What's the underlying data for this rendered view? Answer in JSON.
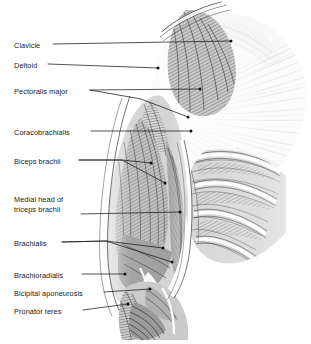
{
  "figure": {
    "background_color": "#ffffff",
    "ink_color": "#1a1a1a",
    "width": 311,
    "height": 344,
    "style": "grayscale engraved anatomical illustration"
  },
  "labels": [
    {
      "id": "clavicle",
      "text": "Clavicle",
      "text2": "",
      "x": 14,
      "y": 41,
      "lines": 1
    },
    {
      "id": "deltoid",
      "text": "Deltoid",
      "text2": "",
      "x": 14,
      "y": 61,
      "lines": 1
    },
    {
      "id": "pectoralis-major",
      "text": "Pectoralis major",
      "text2": "",
      "x": 14,
      "y": 87,
      "lines": 1
    },
    {
      "id": "coracobrachialis",
      "text": "Coracobrachialis",
      "text2": "",
      "x": 14,
      "y": 128,
      "lines": 1
    },
    {
      "id": "biceps-brachii",
      "text": "Biceps brachii",
      "text2": "",
      "x": 14,
      "y": 157,
      "lines": 1
    },
    {
      "id": "triceps-brachii",
      "text": "Medial head of",
      "text2": "triceps brachii",
      "x": 14,
      "y": 195,
      "lines": 2
    },
    {
      "id": "brachialis",
      "text": "Brachialis",
      "text2": "",
      "x": 14,
      "y": 239,
      "lines": 1
    },
    {
      "id": "brachioradialis",
      "text": "Brachioradialis",
      "text2": "",
      "x": 14,
      "y": 271,
      "lines": 1
    },
    {
      "id": "bicipital-aponeurosis",
      "text": "Bicipital aponeurosis",
      "text2": "",
      "x": 14,
      "y": 289,
      "lines": 1
    },
    {
      "id": "pronator-teres",
      "text": "Pronator teres",
      "text2": "",
      "x": 14,
      "y": 307,
      "lines": 1
    }
  ],
  "leaders": [
    {
      "id": "clavicle-leader",
      "path": "M 53 44 L 231 41",
      "dot": [
        231,
        41
      ]
    },
    {
      "id": "deltoid-leader",
      "path": "M 48 64 L 158 68",
      "dot": [
        158,
        68
      ]
    },
    {
      "id": "pectoralis-major-leader-a",
      "path": "M 90 90 L 200 89",
      "dot": [
        200,
        89
      ]
    },
    {
      "id": "pectoralis-major-leader-b",
      "path": "M 90 90 L 141 99 L 188 117",
      "dot": [
        188,
        117
      ]
    },
    {
      "id": "coracobrachialis-leader",
      "path": "M 91 131 L 191 131",
      "dot": [
        191,
        131
      ]
    },
    {
      "id": "biceps-brachii-leader-a",
      "path": "M 79 160 L 122 160 L 151 163",
      "dot": [
        151,
        163
      ]
    },
    {
      "id": "biceps-brachii-leader-b",
      "path": "M 79 160 L 122 160 L 165 183",
      "dot": [
        165,
        183
      ]
    },
    {
      "id": "triceps-brachii-leader",
      "path": "M 81 214 L 180 212",
      "dot": [
        180,
        212
      ]
    },
    {
      "id": "brachialis-leader-a",
      "path": "M 62 242 L 106 241 L 163 248",
      "dot": [
        163,
        248
      ]
    },
    {
      "id": "brachialis-leader-b",
      "path": "M 62 242 L 106 241 L 172 262",
      "dot": [
        172,
        262
      ]
    },
    {
      "id": "brachioradialis-leader",
      "path": "M 82 274 L 125 274",
      "dot": [
        125,
        274
      ]
    },
    {
      "id": "bicipital-aponeurosis-leader",
      "path": "M 104 292 L 150 289",
      "dot": [
        150,
        289
      ]
    },
    {
      "id": "pronator-teres-leader",
      "path": "M 83 310 L 128 304",
      "dot": [
        128,
        304
      ]
    }
  ],
  "illustration_parts": [
    {
      "id": "clavicle-bone",
      "name": "clavicle"
    },
    {
      "id": "deltoid-muscle",
      "name": "deltoid"
    },
    {
      "id": "pectoralis-major-fan",
      "name": "pectoralis major"
    },
    {
      "id": "coracobrachialis-muscle",
      "name": "coracobrachialis"
    },
    {
      "id": "biceps-brachii-muscle",
      "name": "biceps brachii"
    },
    {
      "id": "triceps-medial-head",
      "name": "medial head of triceps brachii"
    },
    {
      "id": "brachialis-muscle",
      "name": "brachialis"
    },
    {
      "id": "brachioradialis-muscle",
      "name": "brachioradialis"
    },
    {
      "id": "bicipital-aponeurosis-sheet",
      "name": "bicipital aponeurosis"
    },
    {
      "id": "pronator-teres-muscle",
      "name": "pronator teres"
    },
    {
      "id": "rib-cage",
      "name": "ribs and intercostal muscles"
    }
  ]
}
